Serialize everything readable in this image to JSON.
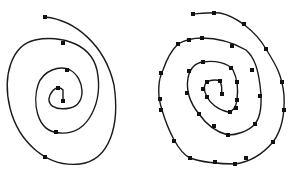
{
  "figure": {
    "colors": {
      "curve": "#1a1a1a",
      "point": "#111111",
      "background": "#ffffff"
    },
    "left_spiral": {
      "path": "M45,17 C75,20 105,45 114,85 C120,125 110,160 80,164 C45,168 18,140 10,108 C2,75 12,45 35,40 C55,36 90,40 97,70 C103,100 90,135 60,133 C35,132 33,100 38,85 C43,70 60,65 70,70 C85,78 87,105 70,108 C55,111 46,105 50,95 C54,87 60,86 63,90 L63,101",
      "points": [
        [
          45,
          17
        ],
        [
          63,
          43
        ],
        [
          67,
          70
        ],
        [
          58,
          88
        ],
        [
          63,
          101
        ],
        [
          56,
          132
        ],
        [
          45,
          157
        ]
      ]
    },
    "right_spiral": {
      "path": "M193,14 C205,13 214,12 220,13 C235,16 255,30 266,49 C276,65 282,75 284,95 C285,115 282,130 273,142 C262,155 250,162 235,164 C220,164 200,162 190,158 C178,152 168,130 162,110 C157,95 158,80 163,70 C168,55 175,47 178,44 C185,40 195,38 202,38 C215,38 232,42 246,50 C255,58 258,70 260,85 C262,100 262,115 255,124 C248,132 235,135 228,135 C220,133 208,127 199,114 C190,103 186,90 188,78 C190,68 195,63 203,62 C215,60 228,63 233,70 C238,80 238,92 237,100 C236,108 232,112 228,112 C218,110 210,103 207,97 C203,90 204,84 207,82 C212,79 218,80 220,81 C222,86 222,92 221,95",
      "points": [
        [
          193,
          14
        ],
        [
          214,
          13
        ],
        [
          244,
          24
        ],
        [
          266,
          49
        ],
        [
          282,
          82
        ],
        [
          284,
          110
        ],
        [
          273,
          142
        ],
        [
          246,
          158
        ],
        [
          235,
          164
        ],
        [
          215,
          162
        ],
        [
          190,
          158
        ],
        [
          174,
          141
        ],
        [
          161,
          110
        ],
        [
          160,
          99
        ],
        [
          161,
          73
        ],
        [
          178,
          44
        ],
        [
          189,
          40
        ],
        [
          202,
          38
        ],
        [
          232,
          46
        ],
        [
          252,
          70
        ],
        [
          260,
          96
        ],
        [
          255,
          124
        ],
        [
          228,
          135
        ],
        [
          214,
          126
        ],
        [
          199,
          114
        ],
        [
          187,
          93
        ],
        [
          189,
          71
        ],
        [
          203,
          62
        ],
        [
          231,
          68
        ],
        [
          237,
          82
        ],
        [
          237,
          100
        ],
        [
          236,
          108
        ],
        [
          230,
          112
        ],
        [
          207,
          97
        ],
        [
          203,
          89
        ],
        [
          207,
          82
        ],
        [
          220,
          81
        ],
        [
          222,
          94
        ]
      ]
    }
  }
}
